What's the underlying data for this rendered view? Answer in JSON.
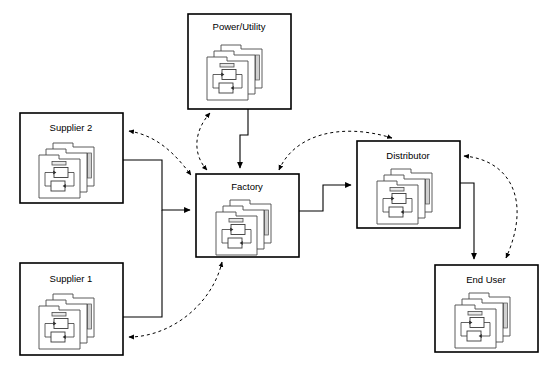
{
  "diagram": {
    "type": "block-flow-diagram",
    "canvas": {
      "width": 547,
      "height": 368,
      "background": "#ffffff"
    },
    "style": {
      "node_stroke": "#000000",
      "solid_edge_color": "#000000",
      "dashed_edge_color": "#000000",
      "icon_stroke": "#4a4a4a",
      "icon_fill": "#ffffff",
      "icon_tab_fill": "#e8e8e8"
    },
    "nodes": [
      {
        "id": "power_utility",
        "label": "Power/Utility",
        "icon": "stacked-process-model-icon",
        "x": 188,
        "y": 14,
        "w": 103,
        "h": 95,
        "label_x": 239,
        "label_y": 27
      },
      {
        "id": "supplier_2",
        "label": "Supplier 2",
        "icon": "stacked-process-model-icon",
        "x": 20,
        "y": 113,
        "w": 103,
        "h": 90,
        "label_x": 71,
        "label_y": 128
      },
      {
        "id": "supplier_1",
        "label": "Supplier 1",
        "icon": "stacked-process-model-icon",
        "x": 20,
        "y": 263,
        "w": 103,
        "h": 92,
        "label_x": 71,
        "label_y": 279
      },
      {
        "id": "factory",
        "label": "Factory",
        "icon": "stacked-process-model-icon",
        "x": 196,
        "y": 174,
        "w": 103,
        "h": 83,
        "label_x": 247,
        "label_y": 187
      },
      {
        "id": "distributor",
        "label": "Distributor",
        "icon": "stacked-process-model-icon",
        "x": 357,
        "y": 141,
        "w": 103,
        "h": 87,
        "label_x": 408,
        "label_y": 156
      },
      {
        "id": "end_user",
        "label": "End User",
        "icon": "stacked-process-model-icon",
        "x": 435,
        "y": 265,
        "w": 103,
        "h": 87,
        "label_x": 486,
        "label_y": 280
      }
    ],
    "edges": [
      {
        "id": "e1",
        "from": "supplier_2",
        "to": "factory",
        "style": "solid",
        "arrow": "single"
      },
      {
        "id": "e2",
        "from": "supplier_1",
        "to": "factory",
        "style": "solid",
        "arrow": "single"
      },
      {
        "id": "e3",
        "from": "power_utility",
        "to": "factory",
        "style": "solid",
        "arrow": "single"
      },
      {
        "id": "e4",
        "from": "factory",
        "to": "distributor",
        "style": "solid",
        "arrow": "single"
      },
      {
        "id": "e5",
        "from": "distributor",
        "to": "end_user",
        "style": "solid",
        "arrow": "single"
      },
      {
        "id": "e6",
        "from": "factory",
        "to": "supplier_2",
        "style": "dashed",
        "arrow": "double"
      },
      {
        "id": "e7",
        "from": "factory",
        "to": "supplier_1",
        "style": "dashed",
        "arrow": "double"
      },
      {
        "id": "e8",
        "from": "factory",
        "to": "power_utility",
        "style": "dashed",
        "arrow": "double"
      },
      {
        "id": "e9",
        "from": "factory",
        "to": "distributor",
        "style": "dashed",
        "arrow": "double"
      },
      {
        "id": "e10",
        "from": "distributor",
        "to": "end_user",
        "style": "dashed",
        "arrow": "double"
      }
    ]
  }
}
